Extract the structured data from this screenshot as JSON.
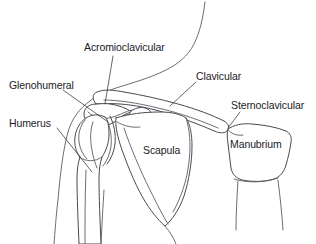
{
  "diagram": {
    "background_color": "#ffffff",
    "line_color": "#4a4a52",
    "text_color": "#1b1b1f"
  },
  "labels": {
    "acromioclavicular": "Acromioclavicular",
    "glenohumeral": "Glenohumeral",
    "humerus": "Humerus",
    "clavicular": "Clavicular",
    "sternoclavicular": "Sternoclavicular",
    "scapula": "Scapula",
    "manubrium": "Manubrium"
  },
  "annotations": [
    {
      "id": "acromioclavicular",
      "text": "Acromioclavicular",
      "type": "joint",
      "label_position": {
        "x": 84,
        "y": 41
      },
      "leader_from": {
        "x": 113,
        "y": 56
      },
      "leader_to": {
        "x": 105,
        "y": 104
      }
    },
    {
      "id": "glenohumeral",
      "text": "Glenohumeral",
      "type": "joint",
      "label_position": {
        "x": 9,
        "y": 79
      },
      "leader_from": {
        "x": 63,
        "y": 90
      },
      "leader_to": {
        "x": 108,
        "y": 122
      }
    },
    {
      "id": "humerus",
      "text": "Humerus",
      "type": "bone",
      "label_position": {
        "x": 9,
        "y": 117
      },
      "leader_from": {
        "x": 57,
        "y": 128
      },
      "leader_to": {
        "x": 92,
        "y": 172
      }
    },
    {
      "id": "clavicular",
      "text": "Clavicular",
      "type": "bone",
      "label_position": {
        "x": 196,
        "y": 70
      },
      "leader_from": {
        "x": 196,
        "y": 82
      },
      "leader_to": {
        "x": 170,
        "y": 106
      }
    },
    {
      "id": "sternoclavicular",
      "text": "Sternoclavicular",
      "type": "joint",
      "label_position": {
        "x": 231,
        "y": 99
      },
      "leader_from": {
        "x": 240,
        "y": 112
      },
      "leader_to": {
        "x": 228,
        "y": 128
      }
    },
    {
      "id": "scapula",
      "text": "Scapula",
      "type": "bone",
      "label_position": {
        "x": 143,
        "y": 144
      },
      "leader_from": null,
      "leader_to": null
    },
    {
      "id": "manubrium",
      "text": "Manubrium",
      "type": "bone",
      "label_position": {
        "x": 230,
        "y": 138
      },
      "leader_from": null,
      "leader_to": null
    }
  ]
}
